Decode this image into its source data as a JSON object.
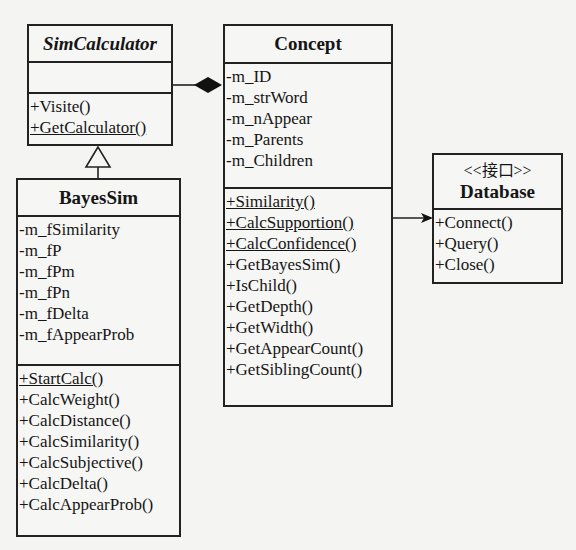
{
  "classes": {
    "simcalculator": {
      "name": "SimCalculator",
      "abstract": true,
      "attributes": [],
      "methods": [
        {
          "label": "+Visite()",
          "static": false
        },
        {
          "label": "+GetCalculator()",
          "static": true
        }
      ]
    },
    "concept": {
      "name": "Concept",
      "attributes": [
        "-m_ID",
        "-m_strWord",
        "-m_nAppear",
        "-m_Parents",
        "-m_Children"
      ],
      "methods": [
        {
          "label": "+Similarity()",
          "static": true
        },
        {
          "label": "+CalcSupportion()",
          "static": true
        },
        {
          "label": "+CalcConfidence()",
          "static": true
        },
        {
          "label": "+GetBayesSim()",
          "static": false
        },
        {
          "label": "+IsChild()",
          "static": false
        },
        {
          "label": "+GetDepth()",
          "static": false
        },
        {
          "label": "+GetWidth()",
          "static": false
        },
        {
          "label": "+GetAppearCount()",
          "static": false
        },
        {
          "label": "+GetSiblingCount()",
          "static": false
        }
      ]
    },
    "database": {
      "stereotype": "<<接口>>",
      "name": "Database",
      "methods": [
        {
          "label": "+Connect()",
          "static": false
        },
        {
          "label": "+Query()",
          "static": false
        },
        {
          "label": "+Close()",
          "static": false
        }
      ]
    },
    "bayessim": {
      "name": "BayesSim",
      "attributes": [
        "-m_fSimilarity",
        "-m_fP",
        "-m_fPm",
        "-m_fPn",
        "-m_fDelta",
        "-m_fAppearProb"
      ],
      "methods": [
        {
          "label": "+StartCalc()",
          "static": true
        },
        {
          "label": "+CalcWeight()",
          "static": false
        },
        {
          "label": "+CalcDistance()",
          "static": false
        },
        {
          "label": "+CalcSimilarity()",
          "static": false
        },
        {
          "label": "+CalcSubjective()",
          "static": false
        },
        {
          "label": "+CalcDelta()",
          "static": false
        },
        {
          "label": "+CalcAppearProb()",
          "static": false
        }
      ]
    }
  },
  "relations": [
    {
      "type": "composition",
      "from": "SimCalculator",
      "to": "Concept"
    },
    {
      "type": "generalization",
      "from": "BayesSim",
      "to": "SimCalculator"
    },
    {
      "type": "dependency",
      "from": "Concept",
      "to": "Database"
    }
  ]
}
